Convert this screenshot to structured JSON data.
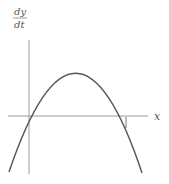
{
  "diagram": {
    "y_label_numerator": "dy",
    "y_label_denominator": "dt",
    "x_label": "x",
    "curve": "downward parabola crossing x-axis twice",
    "colors": {
      "axis": "#9a9a9a",
      "curve": "#555555",
      "text": "#555555"
    }
  }
}
